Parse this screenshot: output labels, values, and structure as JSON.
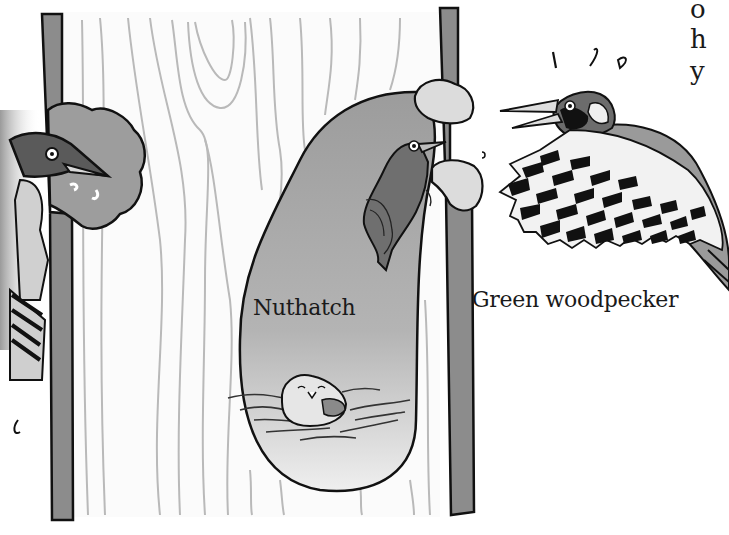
{
  "illustration": {
    "subject": "Woodpeckers and nuthatch at tree nest hole",
    "labels": {
      "nuthatch": "Nuthatch",
      "green_woodpecker": "Green woodpecker"
    },
    "text_fragments": [
      "o",
      "h",
      "y"
    ],
    "colors": {
      "background": "#ffffff",
      "trunk_bark": "#8a8a8a",
      "wood_grain": "#b8b8b8",
      "hole_interior": "#b0b0b0",
      "outline": "#111111"
    }
  }
}
